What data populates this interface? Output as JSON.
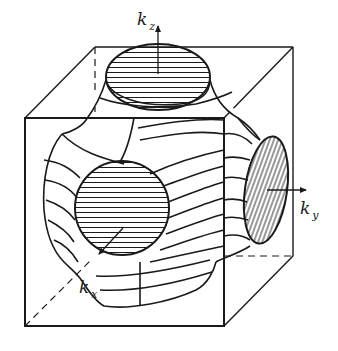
{
  "figure": {
    "axes": [
      {
        "id": "kz",
        "symbol": "k",
        "subscript": "z"
      },
      {
        "id": "ky",
        "symbol": "k",
        "subscript": "y"
      },
      {
        "id": "kx",
        "symbol": "k",
        "subscript": "x"
      }
    ],
    "colors": {
      "line": "#1a1a1a",
      "background": "#ffffff"
    }
  }
}
